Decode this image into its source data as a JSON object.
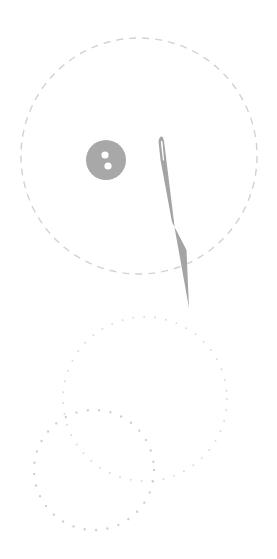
{
  "illustration": {
    "description": "Sewing button and needle with dashed and dotted circles",
    "colors": {
      "background": "#ffffff",
      "button": "#a8a8a8",
      "needle": "#a4a4a4",
      "dashed_circle": "#d2d2d2",
      "dotted_circle": "#d8d8d8"
    },
    "icons": [
      "button-icon",
      "needle-icon"
    ]
  }
}
